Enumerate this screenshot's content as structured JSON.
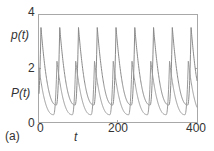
{
  "chart_data": {
    "type": "line",
    "title": "",
    "panel_label": "(a)",
    "xlabel": "t",
    "ylabel": "",
    "xlim": [
      0,
      400
    ],
    "ylim": [
      0,
      4
    ],
    "x_ticks": [
      "0",
      "200",
      "400"
    ],
    "y_ticks": [
      "0",
      "2",
      "4"
    ],
    "grid": false,
    "legend": "inline labels",
    "series": [
      {
        "name": "p(t)",
        "label_position": "upper left",
        "period": 47.5,
        "peak_value": 3.5,
        "trough_value": 0.63,
        "first_peak_t": 5,
        "peaks_t": [
          5,
          53,
          100,
          148,
          195,
          243,
          290,
          338,
          385
        ],
        "color": "#8a8a8a"
      },
      {
        "name": "P(t)",
        "label_position": "lower left",
        "period": 47.5,
        "peak_value": 2.25,
        "trough_value": 0.27,
        "first_peak_t": -2,
        "peaks_t": [
          -2,
          45,
          93,
          140,
          188,
          235,
          283,
          330,
          378
        ],
        "color": "#9a9a9a"
      }
    ]
  },
  "labels": {
    "series_p": "p(t)",
    "series_P": "P(t)",
    "y4": "4",
    "y2": "2",
    "y0": "0",
    "x0": "0",
    "x200": "200",
    "x400": "400",
    "xlabel": "t",
    "panel": "(a)"
  },
  "colors": {
    "axis": "#9a9a9a",
    "text": "#333333"
  }
}
